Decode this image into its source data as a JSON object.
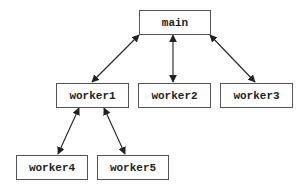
{
  "diagram": {
    "type": "tree",
    "nodes": [
      {
        "id": "main",
        "label": "main",
        "x": 139,
        "y": 10,
        "w": 71,
        "h": 24
      },
      {
        "id": "worker1",
        "label": "worker1",
        "x": 56,
        "y": 83,
        "w": 72,
        "h": 24
      },
      {
        "id": "worker2",
        "label": "worker2",
        "x": 138,
        "y": 83,
        "w": 72,
        "h": 24
      },
      {
        "id": "worker3",
        "label": "worker3",
        "x": 220,
        "y": 83,
        "w": 72,
        "h": 24
      },
      {
        "id": "worker4",
        "label": "worker4",
        "x": 16,
        "y": 155,
        "w": 71,
        "h": 24
      },
      {
        "id": "worker5",
        "label": "worker5",
        "x": 97,
        "y": 155,
        "w": 71,
        "h": 24
      }
    ],
    "edges": [
      {
        "from": "main",
        "to": "worker1",
        "bidirectional": true,
        "x1": 139,
        "y1": 35,
        "x2": 92,
        "y2": 82
      },
      {
        "from": "main",
        "to": "worker2",
        "bidirectional": true,
        "x1": 173,
        "y1": 35,
        "x2": 173,
        "y2": 82
      },
      {
        "from": "main",
        "to": "worker3",
        "bidirectional": true,
        "x1": 210,
        "y1": 35,
        "x2": 255,
        "y2": 82
      },
      {
        "from": "worker1",
        "to": "worker4",
        "bidirectional": true,
        "x1": 79,
        "y1": 108,
        "x2": 58,
        "y2": 154
      },
      {
        "from": "worker1",
        "to": "worker5",
        "bidirectional": true,
        "x1": 104,
        "y1": 108,
        "x2": 125,
        "y2": 154
      }
    ],
    "colors": {
      "stroke": "#222222",
      "box_border": "#555555",
      "background": "#ffffff"
    }
  }
}
